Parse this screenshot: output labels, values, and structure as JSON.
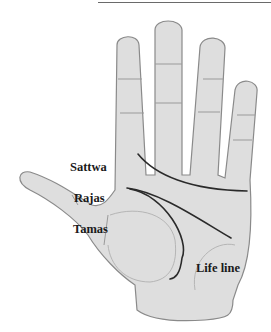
{
  "diagram": {
    "labels": {
      "sattwa": "Sattwa",
      "rajas": "Rajas",
      "tamas": "Tamas",
      "life_line": "Life line"
    },
    "colors": {
      "skin": "#dcdcdc",
      "outline": "#8a8a8a",
      "palm_line": "#2a2a2a",
      "text": "#1a1a1a"
    }
  }
}
